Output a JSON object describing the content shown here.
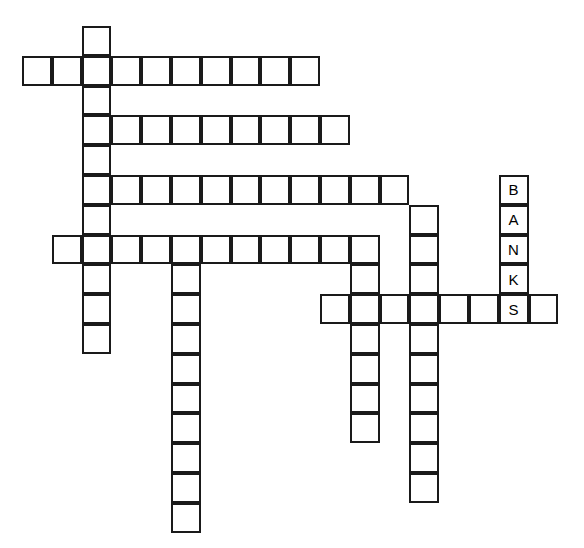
{
  "puzzle": {
    "title": "Crossword Grid",
    "grid": {
      "origin_x": 22,
      "origin_y": 26,
      "cell_size": 29.8,
      "border_color": "#1a1a1a",
      "cell_fill": "#ffffff",
      "background": "#ffffff",
      "border_width": 2
    },
    "entries": [
      {
        "id": "across-1",
        "name": "across-row1",
        "direction": "across",
        "row": 1,
        "col": 0,
        "length": 10,
        "letters": [
          "",
          "",
          "",
          "",
          "",
          "",
          "",
          "",
          "",
          ""
        ]
      },
      {
        "id": "across-2",
        "name": "across-row3",
        "direction": "across",
        "row": 3,
        "col": 2,
        "length": 9,
        "letters": [
          "",
          "",
          "",
          "",
          "",
          "",
          "",
          "",
          ""
        ]
      },
      {
        "id": "across-3",
        "name": "across-row5",
        "direction": "across",
        "row": 5,
        "col": 2,
        "length": 11,
        "letters": [
          "",
          "",
          "",
          "",
          "",
          "",
          "",
          "",
          "",
          "",
          ""
        ]
      },
      {
        "id": "across-4",
        "name": "across-row7",
        "direction": "across",
        "row": 7,
        "col": 1,
        "length": 11,
        "letters": [
          "",
          "",
          "",
          "",
          "",
          "",
          "",
          "",
          "",
          "",
          ""
        ]
      },
      {
        "id": "across-5",
        "name": "across-row9",
        "direction": "across",
        "row": 9,
        "col": 10,
        "length": 8,
        "letters": [
          "",
          "",
          "",
          "",
          "",
          "",
          "S",
          ""
        ]
      },
      {
        "id": "down-1",
        "name": "down-col2",
        "direction": "down",
        "row": 0,
        "col": 2,
        "length": 11,
        "letters": [
          "",
          "",
          "",
          "",
          "",
          "",
          "",
          "",
          "",
          "",
          ""
        ]
      },
      {
        "id": "down-2",
        "name": "down-col5",
        "direction": "down",
        "row": 8,
        "col": 5,
        "length": 9,
        "letters": [
          "",
          "",
          "",
          "",
          "",
          "",
          "",
          "",
          ""
        ]
      },
      {
        "id": "down-3",
        "name": "down-col11",
        "direction": "down",
        "row": 7,
        "col": 11,
        "length": 7,
        "letters": [
          "",
          "",
          "",
          "",
          "",
          "",
          ""
        ]
      },
      {
        "id": "down-4",
        "name": "down-col13",
        "direction": "down",
        "row": 6,
        "col": 13,
        "length": 10,
        "letters": [
          "",
          "",
          "",
          "",
          "",
          "",
          "",
          "",
          "",
          ""
        ]
      },
      {
        "id": "down-5",
        "name": "down-col16-banks",
        "direction": "down",
        "row": 5,
        "col": 16,
        "length": 5,
        "letters": [
          "B",
          "A",
          "N",
          "K",
          "S"
        ]
      }
    ],
    "answers_shown": {
      "banks": "BANKS",
      "letters_visible": [
        "B",
        "A",
        "N",
        "K",
        "S"
      ]
    }
  }
}
